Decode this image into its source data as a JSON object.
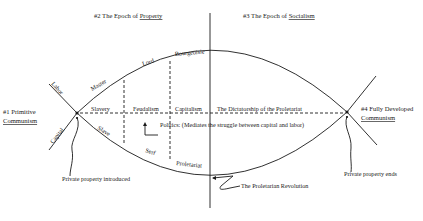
{
  "diagram": {
    "type": "historical-epochs-diagram",
    "colors": {
      "ink": "#1a1a1a",
      "background": "#ffffff"
    },
    "epochs": {
      "e1": {
        "prefix": "#1 Primitive",
        "underlined": "Communism"
      },
      "e2": {
        "prefix": "#2 The Epoch of ",
        "underlined": "Property"
      },
      "e3": {
        "prefix": "#3 The Epoch of ",
        "underlined": "Socialism"
      },
      "e4": {
        "prefix": "#4 Fully Developed",
        "underlined": "Communism"
      }
    },
    "axes": {
      "labor": "Labor",
      "capital": "Capital"
    },
    "upper_curve": [
      "Master",
      "Lord",
      "Bourgeoisie"
    ],
    "lower_curve": [
      "Slave",
      "Serf",
      "Proletariat"
    ],
    "middle_line": [
      "Slavery",
      "Feudalism",
      "Capitalism",
      "The Dictatorship of the Proletariat"
    ],
    "annotations": {
      "politics": "Politics: (Mediates the struggle between capital and labor)",
      "property_introduced": "Private property introduced",
      "property_ends": "Private property ends",
      "revolution": "The Proletarian Revolution"
    }
  }
}
